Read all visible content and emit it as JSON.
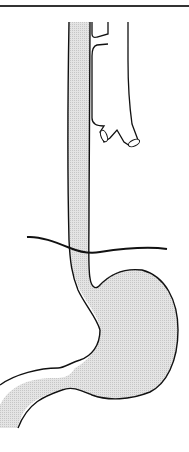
{
  "figure": {
    "labels": {
      "esophagus": "esophagus",
      "trachea": "trachea",
      "diaphragm": "diaphragm",
      "stomach": "stomach",
      "duodenum": "duodenum"
    },
    "colors": {
      "line": "#111111",
      "fill": "#dcdcdc",
      "background": "#ffffff",
      "top_rule": "#333333"
    }
  }
}
